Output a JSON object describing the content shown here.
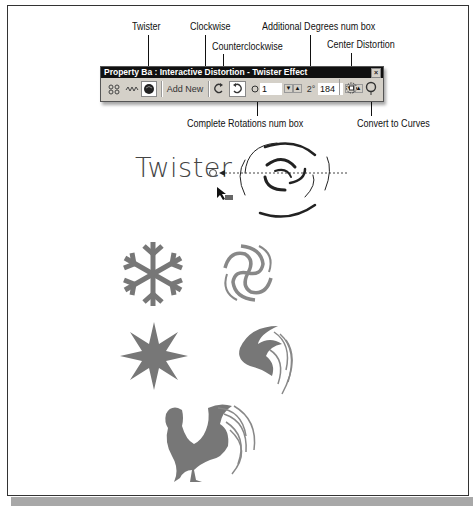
{
  "callouts": {
    "twister": "Twister",
    "clockwise": "Clockwise",
    "counterclockwise": "Counterclockwise",
    "additional_degrees": "Additional Degrees num box",
    "center_distortion": "Center Distortion",
    "complete_rotations": "Complete Rotations num box",
    "convert_to_curves": "Convert to Curves"
  },
  "property_bar": {
    "title": "Property Ba : Interactive Distortion - Twister Effect",
    "close_glyph": "×",
    "add_new_label": "Add New",
    "complete_rotations_value": "1",
    "additional_degrees_value": "184",
    "spin_down": "▼",
    "spin_up": "▲",
    "degrees_symbol": "2°",
    "icons": [
      "push-pull-icon",
      "zipper-icon",
      "twister-icon",
      "add-new-button",
      "clockwise-icon",
      "counterclockwise-icon",
      "rotations-icon",
      "degrees-icon",
      "center-distortion-icon",
      "convert-to-curves-icon"
    ]
  },
  "canvas": {
    "heading": "Twister",
    "examples": [
      "snowflake",
      "snowflake-twisted",
      "star",
      "star-twisted",
      "rooster",
      "rooster-twisted"
    ]
  }
}
